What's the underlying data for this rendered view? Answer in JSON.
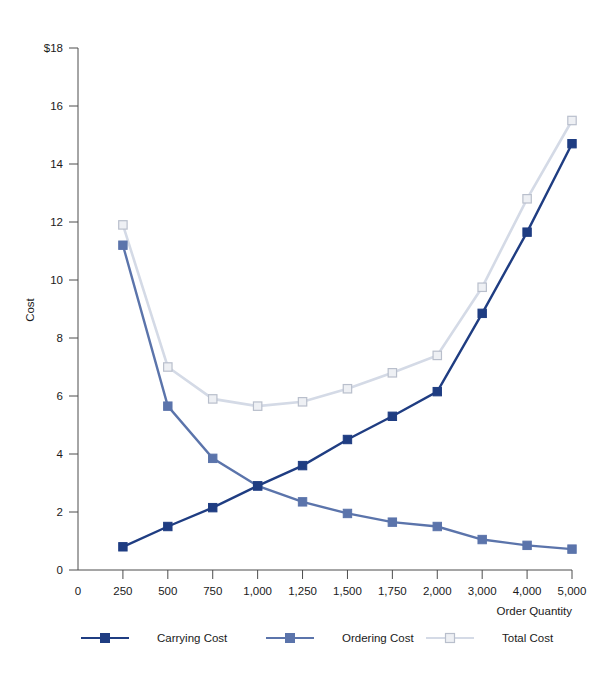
{
  "chart_data": {
    "type": "line",
    "title": "",
    "xlabel": "Order Quantity",
    "ylabel": "Cost",
    "grid": false,
    "legend_position": "bottom",
    "categories": [
      "0",
      "250",
      "500",
      "750",
      "1,000",
      "1,250",
      "1,500",
      "1,750",
      "2,000",
      "3,000",
      "4,000",
      "5,000"
    ],
    "ytick_labels": [
      "0",
      "2",
      "4",
      "6",
      "8",
      "10",
      "12",
      "14",
      "16",
      "$18"
    ],
    "ytick_values": [
      0,
      2,
      4,
      6,
      8,
      10,
      12,
      14,
      16,
      18
    ],
    "ylim": [
      0,
      18
    ],
    "series": [
      {
        "name": "Carrying Cost",
        "color": "#1f3d82",
        "marker": "square-filled",
        "x": [
          "250",
          "500",
          "750",
          "1,000",
          "1,250",
          "1,500",
          "1,750",
          "2,000",
          "3,000",
          "4,000",
          "5,000"
        ],
        "values": [
          0.8,
          1.5,
          2.15,
          2.9,
          3.6,
          4.5,
          5.3,
          6.15,
          8.85,
          11.65,
          14.7
        ]
      },
      {
        "name": "Ordering Cost",
        "color": "#5b74ab",
        "marker": "square-filled",
        "x": [
          "250",
          "500",
          "750",
          "1,000",
          "1,250",
          "1,500",
          "1,750",
          "2,000",
          "3,000",
          "4,000",
          "5,000"
        ],
        "values": [
          11.2,
          5.65,
          3.85,
          2.9,
          2.35,
          1.95,
          1.65,
          1.5,
          1.05,
          0.85,
          0.72
        ]
      },
      {
        "name": "Total Cost",
        "color": "#d4dae6",
        "marker": "square-open",
        "x": [
          "250",
          "500",
          "750",
          "1,000",
          "1,250",
          "1,500",
          "1,750",
          "2,000",
          "3,000",
          "4,000",
          "5,000"
        ],
        "values": [
          11.9,
          7.0,
          5.9,
          5.65,
          5.8,
          6.25,
          6.8,
          7.4,
          9.75,
          12.8,
          15.5
        ]
      }
    ]
  },
  "legend": {
    "items": [
      {
        "label": "Carrying Cost",
        "color": "#1f3d82",
        "marker": "square-filled"
      },
      {
        "label": "Ordering Cost",
        "color": "#5b74ab",
        "marker": "square-filled"
      },
      {
        "label": "Total Cost",
        "color": "#d4dae6",
        "marker": "square-open"
      }
    ]
  }
}
